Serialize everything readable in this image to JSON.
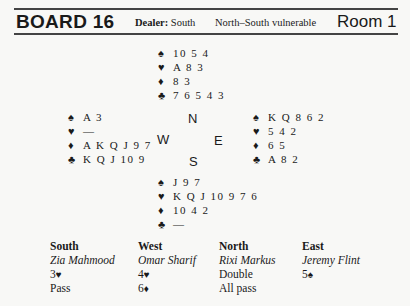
{
  "header": {
    "board": "BOARD 16",
    "dealer_label": "Dealer:",
    "dealer": "South",
    "vulnerability": "North–South vulnerable",
    "room": "Room 1"
  },
  "suit_icons": {
    "spades": "♠",
    "hearts": "♥",
    "diamonds": "♦",
    "clubs": "♣"
  },
  "compass": {
    "north": "N",
    "west": "W",
    "east": "E",
    "south": "S"
  },
  "hands": {
    "north": {
      "spades": "10 5 4",
      "hearts": "A 8 3",
      "diamonds": "8 3",
      "clubs": "7 6 5 4 3"
    },
    "west": {
      "spades": "A 3",
      "hearts": "—",
      "diamonds": "A K Q J 9 7",
      "clubs": "K Q J 10 9"
    },
    "east": {
      "spades": "K Q 8 6 2",
      "hearts": "5 4 2",
      "diamonds": "6 5",
      "clubs": "A 8 2"
    },
    "south": {
      "spades": "J 9 7",
      "hearts": "K Q J 10 9 7 6",
      "diamonds": "10 4 2",
      "clubs": "—"
    }
  },
  "auction": {
    "columns": [
      {
        "seat": "South",
        "player": "Zia Mahmood",
        "bids": [
          {
            "level": "3",
            "suit": "♥"
          },
          {
            "level": "Pass",
            "suit": ""
          }
        ]
      },
      {
        "seat": "West",
        "player": "Omar Sharif",
        "bids": [
          {
            "level": "4",
            "suit": "♥"
          },
          {
            "level": "6",
            "suit": "♦"
          }
        ]
      },
      {
        "seat": "North",
        "player": "Rixi Markus",
        "bids": [
          {
            "level": "Double",
            "suit": ""
          },
          {
            "level": "All pass",
            "suit": ""
          }
        ]
      },
      {
        "seat": "East",
        "player": "Jeremy Flint",
        "bids": [
          {
            "level": "5",
            "suit": "♠"
          }
        ]
      }
    ]
  }
}
